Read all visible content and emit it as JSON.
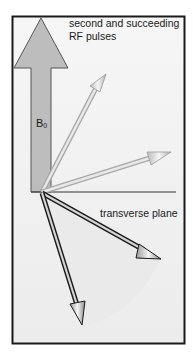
{
  "diagram": {
    "title_lines": [
      "second and succeeding",
      "RF pulses"
    ],
    "b0_label": {
      "main": "B",
      "sub": "0"
    },
    "plane_label": "transverse plane",
    "colors": {
      "frame_border": "#1a1a1a",
      "background": "#f2f2f2",
      "b0_arrow_fill": "#bdbdbd",
      "light_vector": "#cfcfcf",
      "dark_vector_outline": "#1a1a1a",
      "dark_vector_fill": "#d8d8d8",
      "sector_fill": "#e6e6e6"
    },
    "vectors": [
      {
        "name": "upper-tipped-vector",
        "tip": [
          103,
          68
        ],
        "style": "light"
      },
      {
        "name": "near-horizontal-vector",
        "tip": [
          170,
          153
        ],
        "style": "light"
      },
      {
        "name": "transverse-vector-right",
        "tip": [
          160,
          258
        ],
        "style": "dark"
      },
      {
        "name": "transverse-vector-down",
        "tip": [
          82,
          325
        ],
        "style": "dark"
      }
    ]
  }
}
